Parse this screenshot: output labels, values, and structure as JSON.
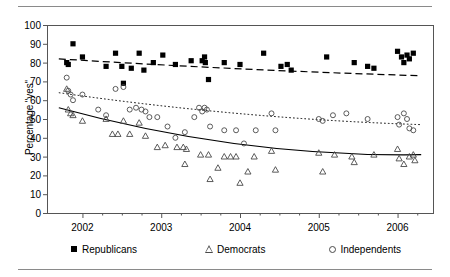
{
  "figure": {
    "has_top_rule": true,
    "has_bottom_rule": true,
    "rule_color": "#8a8a8a"
  },
  "chart_data": {
    "type": "scatter",
    "title": "",
    "subtitle": "",
    "xlabel": "",
    "ylabel": "Percentage \"yes\"",
    "xlim": [
      2001.55,
      2006.45
    ],
    "ylim": [
      0,
      100
    ],
    "ytick_labels": [
      "0",
      "10",
      "20",
      "30",
      "40",
      "50",
      "60",
      "70",
      "80",
      "90",
      "100"
    ],
    "ytick_values": [
      0,
      10,
      20,
      30,
      40,
      50,
      60,
      70,
      80,
      90,
      100
    ],
    "xtick_labels": [
      "2002",
      "2003",
      "2004",
      "2005",
      "2006"
    ],
    "xtick_values": [
      2002,
      2003,
      2004,
      2005,
      2006
    ],
    "minor_xtick_values": [
      2002.25,
      2002.5,
      2002.75,
      2003.25,
      2003.5,
      2003.75,
      2004.25,
      2004.5,
      2004.75,
      2005.25,
      2005.5,
      2005.75,
      2006.25
    ],
    "grid": false,
    "legend_position": "below",
    "frame_color": "#555555",
    "series": [
      {
        "name": "Republicans",
        "marker": "filled-square",
        "color": "#000000",
        "fit_line_style": "dashed",
        "points": [
          [
            2001.8,
            80
          ],
          [
            2001.82,
            79
          ],
          [
            2001.88,
            90
          ],
          [
            2002.0,
            83
          ],
          [
            2002.3,
            78
          ],
          [
            2002.42,
            85
          ],
          [
            2002.5,
            78
          ],
          [
            2002.52,
            69
          ],
          [
            2002.62,
            77
          ],
          [
            2002.72,
            85
          ],
          [
            2002.78,
            76
          ],
          [
            2002.9,
            80
          ],
          [
            2003.02,
            84
          ],
          [
            2003.18,
            79
          ],
          [
            2003.38,
            81
          ],
          [
            2003.52,
            81
          ],
          [
            2003.55,
            83
          ],
          [
            2003.56,
            80
          ],
          [
            2003.6,
            71
          ],
          [
            2003.8,
            80
          ],
          [
            2004.0,
            79
          ],
          [
            2004.3,
            85
          ],
          [
            2004.52,
            78
          ],
          [
            2004.6,
            79
          ],
          [
            2004.65,
            76
          ],
          [
            2005.1,
            83
          ],
          [
            2005.45,
            80
          ],
          [
            2005.62,
            78
          ],
          [
            2005.7,
            77
          ],
          [
            2006.0,
            86
          ],
          [
            2006.05,
            83
          ],
          [
            2006.08,
            80
          ],
          [
            2006.12,
            84
          ],
          [
            2006.15,
            82
          ],
          [
            2006.2,
            85
          ]
        ],
        "fit_line": [
          [
            2001.7,
            82
          ],
          [
            2006.3,
            73
          ]
        ]
      },
      {
        "name": "Democrats",
        "marker": "open-triangle",
        "color": "#4a4a4a",
        "fit_line_style": "solid",
        "points": [
          [
            2001.8,
            66
          ],
          [
            2001.82,
            55
          ],
          [
            2001.85,
            53
          ],
          [
            2001.88,
            52
          ],
          [
            2002.0,
            49
          ],
          [
            2002.3,
            50
          ],
          [
            2002.38,
            42
          ],
          [
            2002.45,
            42
          ],
          [
            2002.52,
            49
          ],
          [
            2002.6,
            42
          ],
          [
            2002.72,
            48
          ],
          [
            2002.8,
            41
          ],
          [
            2002.95,
            35
          ],
          [
            2003.05,
            36
          ],
          [
            2003.2,
            35
          ],
          [
            2003.28,
            35
          ],
          [
            2003.3,
            26
          ],
          [
            2003.32,
            34
          ],
          [
            2003.5,
            31
          ],
          [
            2003.6,
            31
          ],
          [
            2003.62,
            18
          ],
          [
            2003.72,
            24
          ],
          [
            2003.8,
            30
          ],
          [
            2003.88,
            30
          ],
          [
            2003.95,
            30
          ],
          [
            2004.0,
            16
          ],
          [
            2004.1,
            22
          ],
          [
            2004.18,
            30
          ],
          [
            2004.4,
            33
          ],
          [
            2004.45,
            23
          ],
          [
            2005.0,
            32
          ],
          [
            2005.05,
            22
          ],
          [
            2005.2,
            31
          ],
          [
            2005.42,
            30
          ],
          [
            2005.45,
            27
          ],
          [
            2005.7,
            31
          ],
          [
            2006.0,
            34
          ],
          [
            2006.02,
            29
          ],
          [
            2006.08,
            26
          ],
          [
            2006.15,
            30
          ],
          [
            2006.2,
            31
          ],
          [
            2006.22,
            28
          ]
        ],
        "fit_line": [
          [
            2001.7,
            56
          ],
          [
            2006.3,
            31
          ]
        ]
      },
      {
        "name": "Independents",
        "marker": "open-circle",
        "color": "#4a4a4a",
        "fit_line_style": "dotted",
        "points": [
          [
            2001.8,
            72
          ],
          [
            2001.82,
            65
          ],
          [
            2001.85,
            63
          ],
          [
            2001.88,
            60
          ],
          [
            2002.0,
            63
          ],
          [
            2002.2,
            55
          ],
          [
            2002.3,
            52
          ],
          [
            2002.42,
            66
          ],
          [
            2002.52,
            67
          ],
          [
            2002.6,
            55
          ],
          [
            2002.68,
            56
          ],
          [
            2002.75,
            55
          ],
          [
            2002.8,
            54
          ],
          [
            2002.85,
            51
          ],
          [
            2002.95,
            51
          ],
          [
            2003.08,
            46
          ],
          [
            2003.18,
            40
          ],
          [
            2003.3,
            43
          ],
          [
            2003.42,
            51
          ],
          [
            2003.48,
            56
          ],
          [
            2003.52,
            54
          ],
          [
            2003.55,
            56
          ],
          [
            2003.58,
            55
          ],
          [
            2003.62,
            46
          ],
          [
            2003.8,
            44
          ],
          [
            2003.95,
            44
          ],
          [
            2004.05,
            37
          ],
          [
            2004.2,
            44
          ],
          [
            2004.4,
            53
          ],
          [
            2004.45,
            44
          ],
          [
            2005.0,
            50
          ],
          [
            2005.05,
            49
          ],
          [
            2005.18,
            52
          ],
          [
            2005.35,
            53
          ],
          [
            2005.62,
            50
          ],
          [
            2006.0,
            51
          ],
          [
            2006.02,
            47
          ],
          [
            2006.08,
            53
          ],
          [
            2006.12,
            50
          ],
          [
            2006.15,
            45
          ],
          [
            2006.2,
            44
          ]
        ],
        "fit_line": [
          [
            2001.7,
            64
          ],
          [
            2006.3,
            47
          ]
        ]
      }
    ]
  },
  "legend": {
    "entries": [
      {
        "label": "Republicans",
        "marker": "filled-square"
      },
      {
        "label": "Democrats",
        "marker": "open-triangle"
      },
      {
        "label": "Independents",
        "marker": "open-circle"
      }
    ]
  }
}
